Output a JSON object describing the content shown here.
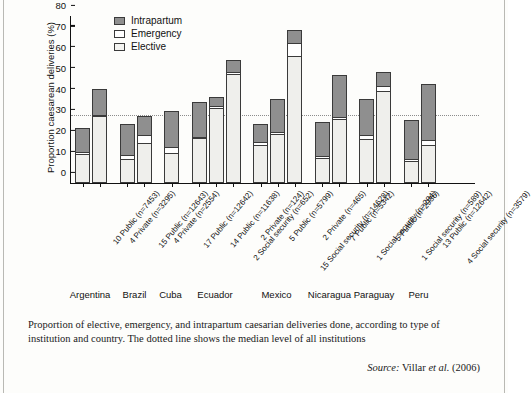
{
  "chart_data": {
    "type": "bar",
    "subtype": "stacked-bar",
    "title": "",
    "xlabel": "",
    "ylabel": "Proportion caesarean deliveries (%)",
    "ylim": [
      0,
      80
    ],
    "yticks": [
      0,
      10,
      20,
      30,
      40,
      50,
      60,
      70,
      80
    ],
    "grid": false,
    "legend_position": "top-left",
    "legend": [
      "Intrapartum",
      "Emergency",
      "Elective"
    ],
    "series": [
      {
        "name": "Elective",
        "values": [
          14.0,
          32.0,
          11.5,
          19.0,
          14.5,
          21.5,
          36.0,
          52.0,
          18.0,
          23.5,
          61.0,
          12.0,
          30.5,
          21.0,
          44.0,
          10.5,
          18.0
        ]
      },
      {
        "name": "Emergency",
        "values": [
          1.5,
          0.5,
          2.5,
          4.5,
          3.0,
          1.0,
          1.5,
          1.5,
          2.0,
          1.5,
          6.5,
          1.5,
          1.5,
          2.5,
          3.0,
          1.5,
          3.0
        ]
      },
      {
        "name": "Intrapartum",
        "values": [
          12.0,
          13.0,
          15.0,
          9.5,
          18.0,
          17.5,
          4.5,
          6.5,
          9.0,
          16.0,
          7.0,
          16.5,
          20.5,
          17.5,
          7.0,
          19.0,
          27.5
        ]
      }
    ],
    "totals": [
      27.5,
      45.5,
      29.0,
      33.0,
      35.5,
      40.0,
      42.0,
      60.0,
      29.0,
      41.0,
      74.5,
      30.0,
      52.5,
      41.0,
      54.0,
      31.0,
      48.5
    ],
    "categories": [
      "10 Public (n=7453)",
      "4 Private (n=3295)",
      "15 Public (n=12643)",
      "4 Private (n=2554)",
      "17 Public (n=12642)",
      "14 Public (n=11638)",
      "2 Social security (n=652)",
      "2 Private (n=124)",
      "5 Public (n=5799)",
      "15 Social security (n=14628)",
      "2 Private (n=465)",
      "7 Public (n=5342)",
      "1 Social security (n=294)",
      "5 Public (n=2936)",
      "1 Social security (n=589)",
      "13 Public (n=12642)",
      "4 Social security (n=3579)"
    ],
    "country_groups": [
      {
        "label": "Argentina",
        "bars": [
          0,
          1
        ]
      },
      {
        "label": "Brazil",
        "bars": [
          2,
          3
        ]
      },
      {
        "label": "Cuba",
        "bars": [
          4
        ]
      },
      {
        "label": "Ecuador",
        "bars": [
          5,
          6,
          7
        ]
      },
      {
        "label": "Mexico",
        "bars": [
          8,
          9,
          10
        ]
      },
      {
        "label": "Nicaragua",
        "bars": [
          11,
          12
        ]
      },
      {
        "label": "Paraguay",
        "bars": [
          13,
          14
        ]
      },
      {
        "label": "Peru",
        "bars": [
          15,
          16
        ]
      }
    ],
    "annotations": [
      {
        "type": "hline",
        "label": "median level of all institutions",
        "value": 32,
        "style": "dotted"
      }
    ],
    "colors": {
      "intrapartum": "#8f8f8f",
      "emergency": "#ffffff",
      "elective": "#efefec",
      "outline": "#3a3a3a",
      "axis": "#111111",
      "median_line": "#8c8c8c"
    }
  },
  "caption": {
    "text": "Proportion of elective, emergency, and intrapartum caesarian deliveries done, according to type of institution and country. The dotted line shows the median level of all institutions",
    "source_label": "Source:",
    "source_value": "Villar",
    "source_etal": "et al.",
    "source_year": "(2006)"
  }
}
